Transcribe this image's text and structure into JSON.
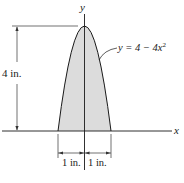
{
  "figure": {
    "type": "parabolic-area-diagram",
    "colors": {
      "line": "#1a1a1a",
      "fill": "#dcdcdc",
      "dimension": "#333333",
      "background": "#ffffff"
    },
    "axes": {
      "x_label": "x",
      "y_label": "y"
    },
    "curve": {
      "label_prefix": "y = 4 − 4",
      "label_var": "x",
      "label_exp": "2",
      "equation": "y = 4 - 4x^2"
    },
    "dimensions": {
      "height_label": "4 in.",
      "left_half_width_label": "1 in.",
      "right_half_width_label": "1 in."
    }
  }
}
